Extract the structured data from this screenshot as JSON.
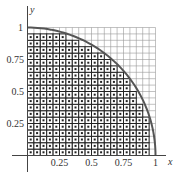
{
  "figure": {
    "grid_divisions": 20,
    "colors": {
      "curve": "#555555",
      "grid_line": "#999999",
      "inner_line": "#222222",
      "dot": "#222222",
      "axis": "#444444",
      "cell_fill": "#ffffff"
    }
  },
  "axes": {
    "x_label": "x",
    "y_label": "y",
    "x_ticks": [
      {
        "value": 0.25,
        "label": "0.25"
      },
      {
        "value": 0.5,
        "label": "0.5"
      },
      {
        "value": 0.75,
        "label": "0.75"
      },
      {
        "value": 1,
        "label": "1"
      }
    ],
    "y_ticks": [
      {
        "value": 0.25,
        "label": "0.25"
      },
      {
        "value": 0.5,
        "label": "0.5"
      },
      {
        "value": 0.75,
        "label": "0.75"
      },
      {
        "value": 1,
        "label": "1"
      }
    ]
  },
  "cells_inside_per_row_bottom_to_top": [
    19,
    19,
    19,
    19,
    19,
    19,
    18,
    18,
    17,
    17,
    16,
    16,
    15,
    14,
    13,
    12,
    10,
    8,
    6,
    0
  ],
  "curve": {
    "equation": "x^2 + y^2 = 1",
    "domain": [
      0,
      1
    ]
  }
}
